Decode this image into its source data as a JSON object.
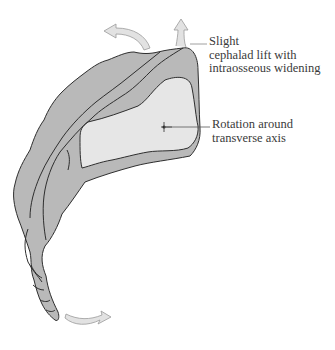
{
  "figure": {
    "colors": {
      "bone_fill": "#b9b9b9",
      "body_fill": "#e6e6e6",
      "outline": "#2e2e2e",
      "arrow_fill": "#e2e2e2",
      "arrow_stroke": "#9a9a9a",
      "leader_line": "#555555"
    }
  },
  "annotations": {
    "lift": {
      "lines": [
        "Slight",
        "cephalad lift with",
        "intraosseous widening"
      ]
    },
    "rotation": {
      "lines": [
        "Rotation around",
        "transverse axis"
      ]
    }
  }
}
